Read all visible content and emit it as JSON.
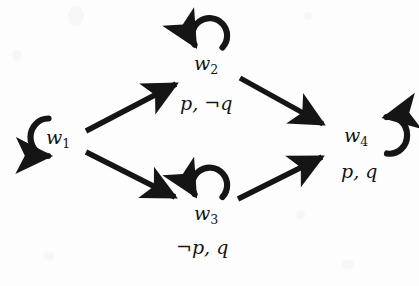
{
  "figure": {
    "type": "state-transition-diagram",
    "background_color": "#fdfdfd",
    "stroke_color": "#151515"
  },
  "nodes": [
    {
      "id": "w1",
      "name": "w",
      "subscript": "1",
      "x": 60,
      "y": 138,
      "self_loop": "left",
      "valuation": ""
    },
    {
      "id": "w2",
      "name": "w",
      "subscript": "2",
      "x": 208,
      "y": 64,
      "self_loop": "top",
      "valuation": "p, ¬q"
    },
    {
      "id": "w3",
      "name": "w",
      "subscript": "3",
      "x": 208,
      "y": 214,
      "self_loop": "top",
      "valuation": "¬p, q"
    },
    {
      "id": "w4",
      "name": "w",
      "subscript": "4",
      "x": 358,
      "y": 135,
      "self_loop": "right",
      "valuation": "p, q"
    }
  ],
  "edges": [
    {
      "from": "w1",
      "to": "w2",
      "x1": 86,
      "y1": 131,
      "x2": 180,
      "y2": 82
    },
    {
      "from": "w1",
      "to": "w3",
      "x1": 86,
      "y1": 152,
      "x2": 179,
      "y2": 199
    },
    {
      "from": "w2",
      "to": "w4",
      "x1": 240,
      "y1": 78,
      "x2": 327,
      "y2": 126
    },
    {
      "from": "w3",
      "to": "w4",
      "x1": 238,
      "y1": 199,
      "x2": 326,
      "y2": 155
    }
  ],
  "labels": {
    "w1": {
      "text_main": "w",
      "text_sub": "1"
    },
    "w2": {
      "text_main": "w",
      "text_sub": "2"
    },
    "w3": {
      "text_main": "w",
      "text_sub": "3"
    },
    "w4": {
      "text_main": "w",
      "text_sub": "4"
    },
    "valuation_w2": {
      "prop1": "p",
      "comma": ", ",
      "neg": "¬",
      "prop2": "q",
      "full": "p, ¬q",
      "x": 180,
      "y": 103
    },
    "valuation_w3": {
      "neg": "¬",
      "prop1": "p",
      "comma": ", ",
      "prop2": "q",
      "full": "¬p, q",
      "x": 176,
      "y": 247
    },
    "valuation_w4": {
      "prop1": "p",
      "comma": ", ",
      "prop2": "q",
      "full": "p, q",
      "x": 341,
      "y": 171
    }
  }
}
